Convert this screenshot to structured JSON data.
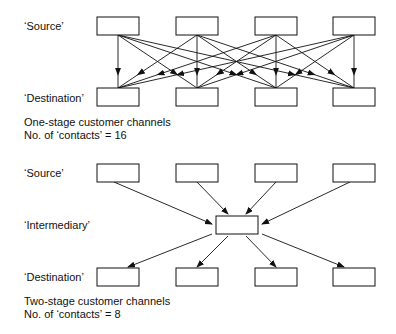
{
  "diagram1": {
    "source_label": "‘Source’",
    "destination_label": "‘Destination’",
    "caption_line1": "One-stage customer channels",
    "caption_line2": "No. of  ‘contacts’ = 16",
    "sources": 4,
    "destinations": 4,
    "contacts": 16
  },
  "diagram2": {
    "source_label": "‘Source’",
    "intermediary_label": "‘Intermediary’",
    "destination_label": "‘Destination’",
    "caption_line1": "Two-stage customer channels",
    "caption_line2": "No. of  ‘contacts’ = 8",
    "sources": 4,
    "intermediaries": 1,
    "destinations": 4,
    "contacts": 8
  },
  "colors": {
    "line": "#111111",
    "background": "#ffffff"
  }
}
